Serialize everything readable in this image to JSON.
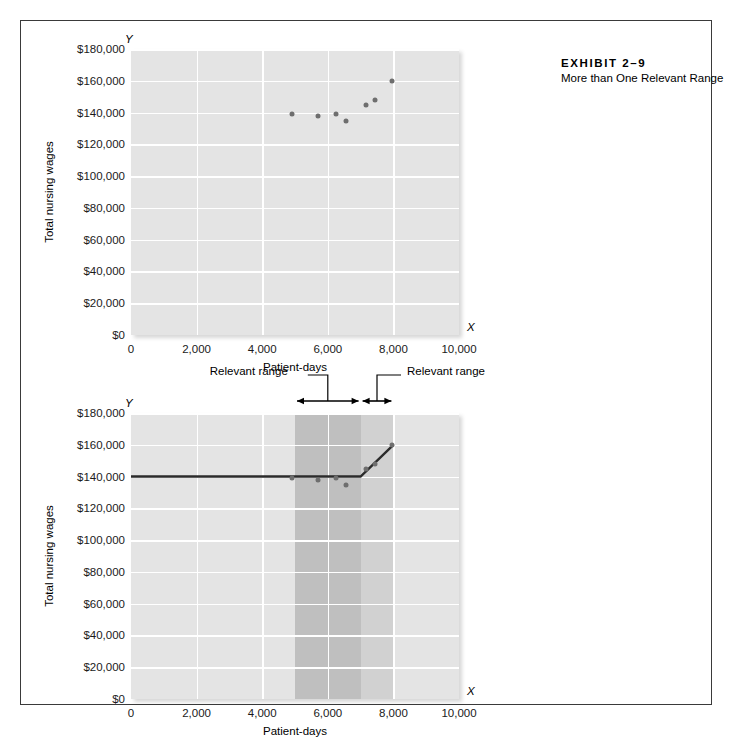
{
  "exhibit": {
    "title": "EXHIBIT 2–9",
    "subtitle": "More than One Relevant Range"
  },
  "labels": {
    "relevant_range_left": "Relevant range",
    "relevant_range_right": "Relevant range",
    "x_axis_letter": "X",
    "y_axis_letter": "Y"
  },
  "chart_data": [
    {
      "type": "scatter",
      "title": "",
      "xlabel": "Patient-days",
      "ylabel": "Total nursing wages",
      "xlim": [
        0,
        10000
      ],
      "ylim": [
        0,
        180000
      ],
      "grid": true,
      "legend": "none",
      "xticks": [
        "0",
        "2,000",
        "4,000",
        "6,000",
        "8,000",
        "10,000"
      ],
      "xtick_values": [
        0,
        2000,
        4000,
        6000,
        8000,
        10000
      ],
      "yticks": [
        "$0",
        "$20,000",
        "$40,000",
        "$60,000",
        "$80,000",
        "$100,000",
        "$120,000",
        "$140,000",
        "$160,000",
        "$180,000"
      ],
      "ytick_values": [
        0,
        20000,
        40000,
        60000,
        80000,
        100000,
        120000,
        140000,
        160000,
        180000
      ],
      "points": [
        {
          "x": 4900,
          "y": 139000
        },
        {
          "x": 5700,
          "y": 138000
        },
        {
          "x": 6250,
          "y": 139000
        },
        {
          "x": 6550,
          "y": 135000
        },
        {
          "x": 7150,
          "y": 145000
        },
        {
          "x": 7450,
          "y": 148000
        },
        {
          "x": 7950,
          "y": 160000
        }
      ]
    },
    {
      "type": "line",
      "title": "",
      "xlabel": "Patient-days",
      "ylabel": "Total nursing wages",
      "xlim": [
        0,
        10000
      ],
      "ylim": [
        0,
        180000
      ],
      "grid": true,
      "legend": "none",
      "xticks": [
        "0",
        "2,000",
        "4,000",
        "6,000",
        "8,000",
        "10,000"
      ],
      "xtick_values": [
        0,
        2000,
        4000,
        6000,
        8000,
        10000
      ],
      "yticks": [
        "$0",
        "$20,000",
        "$40,000",
        "$60,000",
        "$80,000",
        "$100,000",
        "$120,000",
        "$140,000",
        "$160,000",
        "$180,000"
      ],
      "ytick_values": [
        0,
        20000,
        40000,
        60000,
        80000,
        100000,
        120000,
        140000,
        160000,
        180000
      ],
      "points": [
        {
          "x": 4900,
          "y": 139000
        },
        {
          "x": 5700,
          "y": 138000
        },
        {
          "x": 6250,
          "y": 139000
        },
        {
          "x": 6550,
          "y": 135000
        },
        {
          "x": 7150,
          "y": 145000
        },
        {
          "x": 7450,
          "y": 148000
        },
        {
          "x": 7950,
          "y": 160000
        }
      ],
      "cost_line": [
        {
          "x": 0,
          "y": 140000
        },
        {
          "x": 7000,
          "y": 140000
        },
        {
          "x": 8000,
          "y": 160000
        }
      ],
      "bands": [
        {
          "name": "relevant-range-1",
          "x0": 5000,
          "x1": 7000,
          "shade": "dark"
        },
        {
          "name": "relevant-range-2",
          "x0": 7000,
          "x1": 8000,
          "shade": "light"
        }
      ],
      "arrows": [
        {
          "name": "relevant-range-1-arrow",
          "x0": 5000,
          "x1": 7000
        },
        {
          "name": "relevant-range-2-arrow",
          "x0": 7000,
          "x1": 8000
        }
      ]
    }
  ]
}
